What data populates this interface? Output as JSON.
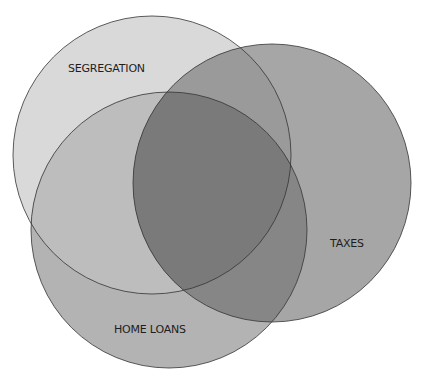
{
  "diagram": {
    "type": "venn",
    "sets": [
      {
        "id": "segregation",
        "label": "SEGREGATION",
        "color": "#d9d9d9"
      },
      {
        "id": "taxes",
        "label": "TAXES",
        "color": "#a6a6a6"
      },
      {
        "id": "home_loans",
        "label": "HOME LOANS",
        "color": "#b3b3b3"
      }
    ],
    "overlap_colors": {
      "segregation_home_loans": "#bdbdbd",
      "segregation_taxes": "#9a9a9a",
      "taxes_home_loans": "#868686",
      "all_three": "#7a7a7a"
    },
    "stroke_color": "#333333"
  }
}
